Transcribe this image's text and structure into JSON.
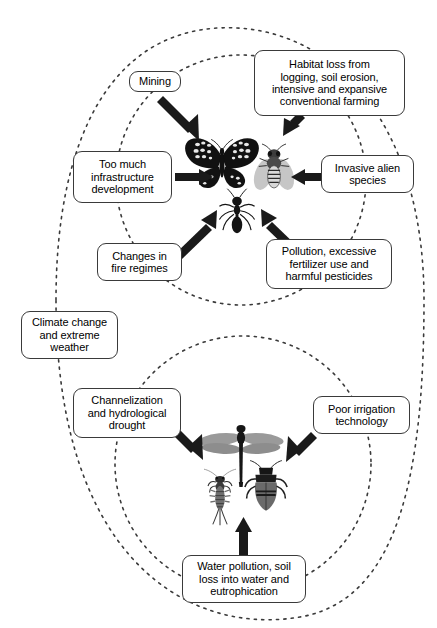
{
  "figure": {
    "background_color": "#ffffff",
    "line_color": "#3a3a3a",
    "arrow_color": "#1a1a1a"
  },
  "outer_group": {
    "name": "all-ecosystems-boundary",
    "style": "dashed-rounded-outline"
  },
  "terrestrial": {
    "group_label": "terrestrial-insects-circle",
    "organisms": [
      {
        "name": "butterfly",
        "label": "butterfly"
      },
      {
        "name": "bee",
        "label": "bee"
      },
      {
        "name": "ant",
        "label": "ant"
      }
    ],
    "drivers": [
      {
        "id": "mining",
        "label": "Mining",
        "box": {
          "x": 129,
          "y": 71,
          "w": 52,
          "h": 21,
          "font": 11
        },
        "arrow": "down-right"
      },
      {
        "id": "habitat-loss",
        "label": "Habitat loss from\nlogging, soil erosion,\nintensive and expansive\nconventional farming",
        "box": {
          "x": 254,
          "y": 50,
          "w": 151,
          "h": 66,
          "font": 11
        },
        "arrow": "down-left"
      },
      {
        "id": "infrastructure",
        "label": "Too much\ninfrastructure\ndevelopment",
        "box": {
          "x": 73,
          "y": 151,
          "w": 99,
          "h": 52,
          "font": 11
        },
        "arrow": "right"
      },
      {
        "id": "invasive-species",
        "label": "Invasive alien\nspecies",
        "box": {
          "x": 321,
          "y": 155,
          "w": 93,
          "h": 38,
          "font": 11
        },
        "arrow": "left"
      },
      {
        "id": "fire-regimes",
        "label": "Changes in\nfire regimes",
        "box": {
          "x": 97,
          "y": 243,
          "w": 85,
          "h": 38,
          "font": 11
        },
        "arrow": "up-right"
      },
      {
        "id": "pollution-pesticides",
        "label": "Pollution, excessive\nfertilizer use and\nharmful pesticides",
        "box": {
          "x": 266,
          "y": 239,
          "w": 126,
          "h": 50,
          "font": 11
        },
        "arrow": "up-left"
      }
    ]
  },
  "freshwater": {
    "group_label": "freshwater-insects-circle",
    "organisms": [
      {
        "name": "dragonfly",
        "label": "dragonfly"
      },
      {
        "name": "mayfly-nymph",
        "label": "mayfly nymph"
      },
      {
        "name": "water-beetle",
        "label": "water beetle"
      }
    ],
    "drivers": [
      {
        "id": "channelization",
        "label": "Channelization\nand hydrological\ndrought",
        "box": {
          "x": 73,
          "y": 388,
          "w": 108,
          "h": 50,
          "font": 11
        },
        "arrow": "down-right"
      },
      {
        "id": "poor-irrigation",
        "label": "Poor irrigation\ntechnology",
        "box": {
          "x": 313,
          "y": 396,
          "w": 97,
          "h": 38,
          "font": 11
        },
        "arrow": "down-left"
      },
      {
        "id": "water-pollution",
        "label": "Water pollution, soil\nloss into water and\neutrophication",
        "box": {
          "x": 182,
          "y": 555,
          "w": 124,
          "h": 48,
          "font": 11
        },
        "arrow": "up"
      }
    ]
  },
  "cross_cutting": {
    "drivers": [
      {
        "id": "climate-change",
        "label": "Climate change\nand extreme\nweather",
        "box": {
          "x": 21,
          "y": 311,
          "w": 97,
          "h": 48,
          "font": 11
        }
      }
    ]
  }
}
